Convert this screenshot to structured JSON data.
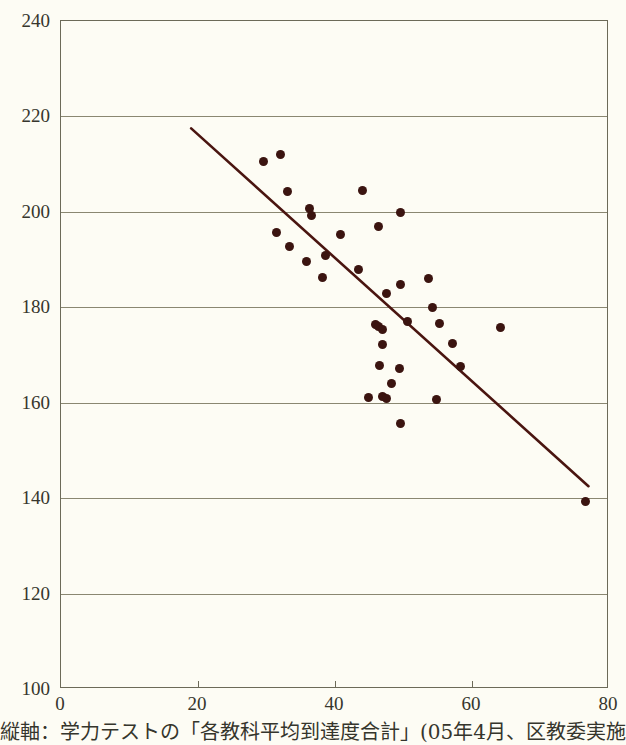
{
  "caption": {
    "text": "縦軸：学力テストの「各教科平均到達度合計」(05年4月、区教委実施"
  },
  "chart_data": {
    "type": "scatter",
    "title": "",
    "subtitle": "",
    "xlabel": "",
    "ylabel": "",
    "xlim": [
      0,
      80
    ],
    "ylim": [
      100,
      240
    ],
    "xticks": [
      0,
      20,
      40,
      60,
      80
    ],
    "yticks": [
      100,
      120,
      140,
      160,
      180,
      200,
      220,
      240
    ],
    "xtick_labels": [
      "0",
      "20",
      "40",
      "60",
      "80"
    ],
    "ytick_labels": [
      "100",
      "120",
      "140",
      "160",
      "180",
      "200",
      "220",
      "240"
    ],
    "grid": "horizontal",
    "legend": "none",
    "marker_color": "#3b1410",
    "axis_color": "#6c6a58",
    "grid_color": "#8a8771",
    "trendline_color": "#4a1510",
    "background_color": "#fdfcf4",
    "series": [
      {
        "name": "districts",
        "points": [
          [
            29.5,
            210.6
          ],
          [
            32.0,
            212.0
          ],
          [
            33.0,
            204.2
          ],
          [
            31.5,
            195.6
          ],
          [
            33.4,
            192.8
          ],
          [
            36.3,
            200.6
          ],
          [
            36.5,
            199.2
          ],
          [
            35.9,
            189.6
          ],
          [
            38.6,
            190.8
          ],
          [
            38.2,
            186.2
          ],
          [
            40.8,
            195.2
          ],
          [
            44.0,
            204.4
          ],
          [
            46.3,
            197.0
          ],
          [
            49.6,
            199.9
          ],
          [
            43.4,
            188.0
          ],
          [
            47.5,
            182.8
          ],
          [
            49.6,
            184.7
          ],
          [
            53.7,
            186.0
          ],
          [
            45.9,
            176.4
          ],
          [
            46.4,
            175.9
          ],
          [
            47.0,
            175.4
          ],
          [
            46.9,
            172.2
          ],
          [
            50.6,
            177.0
          ],
          [
            54.2,
            180.0
          ],
          [
            55.3,
            176.6
          ],
          [
            57.1,
            172.4
          ],
          [
            64.2,
            175.8
          ],
          [
            46.5,
            167.9
          ],
          [
            49.4,
            167.2
          ],
          [
            58.3,
            167.6
          ],
          [
            44.9,
            161.0
          ],
          [
            46.9,
            161.2
          ],
          [
            47.5,
            160.9
          ],
          [
            48.2,
            164.0
          ],
          [
            54.8,
            160.7
          ],
          [
            49.6,
            155.6
          ],
          [
            76.5,
            139.2
          ]
        ]
      }
    ],
    "trendline": {
      "x1": 19.0,
      "y1": 217.5,
      "x2": 77.0,
      "y2": 142.5,
      "style": "solid"
    }
  }
}
